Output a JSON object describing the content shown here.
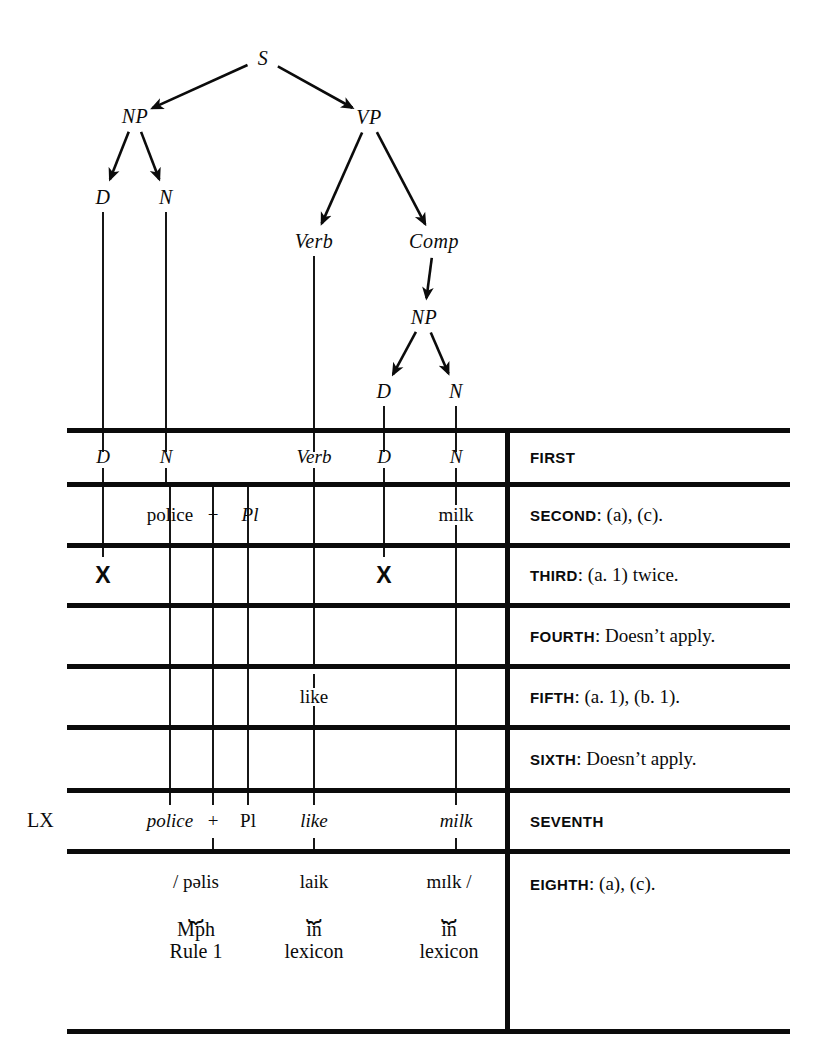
{
  "figure": {
    "type": "syntax-tree-with-derivation-table",
    "colors": {
      "ink": "#0b0b0b",
      "paper": "#ffffff"
    }
  },
  "tree": {
    "nodes": [
      {
        "id": "S",
        "label": "S",
        "x": 263,
        "y": 58
      },
      {
        "id": "NP1",
        "label": "NP",
        "x": 135,
        "y": 116
      },
      {
        "id": "VP",
        "label": "VP",
        "x": 369,
        "y": 117
      },
      {
        "id": "D1",
        "label": "D",
        "x": 103,
        "y": 197
      },
      {
        "id": "N1",
        "label": "N",
        "x": 166,
        "y": 197
      },
      {
        "id": "Verb",
        "label": "Verb",
        "x": 314,
        "y": 241
      },
      {
        "id": "Comp",
        "label": "Comp",
        "x": 434,
        "y": 241
      },
      {
        "id": "NP2",
        "label": "NP",
        "x": 424,
        "y": 317
      },
      {
        "id": "D2",
        "label": "D",
        "x": 384,
        "y": 391
      },
      {
        "id": "N2",
        "label": "N",
        "x": 456,
        "y": 391
      }
    ],
    "edges": [
      {
        "from": "S",
        "to": "NP1"
      },
      {
        "from": "S",
        "to": "VP"
      },
      {
        "from": "NP1",
        "to": "D1"
      },
      {
        "from": "NP1",
        "to": "N1"
      },
      {
        "from": "VP",
        "to": "Verb"
      },
      {
        "from": "VP",
        "to": "Comp"
      },
      {
        "from": "Comp",
        "to": "NP2"
      },
      {
        "from": "NP2",
        "to": "D2"
      },
      {
        "from": "NP2",
        "to": "N2"
      }
    ]
  },
  "table": {
    "left": 67,
    "right": 790,
    "divider_x": 507,
    "rules_y": [
      430,
      484,
      545,
      605,
      666,
      727,
      790,
      851,
      1031
    ],
    "columns": [
      {
        "name": "D-subject",
        "x": 103
      },
      {
        "name": "N-subject",
        "x": 166
      },
      {
        "name": "police",
        "x": 170
      },
      {
        "name": "plus",
        "x": 213
      },
      {
        "name": "Pl",
        "x": 248
      },
      {
        "name": "Verb",
        "x": 314
      },
      {
        "name": "D-object",
        "x": 384
      },
      {
        "name": "N-object",
        "x": 456
      }
    ],
    "rows": [
      {
        "id": "first",
        "ordinal": "FIRST",
        "note": "",
        "cells": [
          {
            "text": "D",
            "x": 103,
            "style": "italic"
          },
          {
            "text": "N",
            "x": 166,
            "style": "italic"
          },
          {
            "text": "Verb",
            "x": 314,
            "style": "italic"
          },
          {
            "text": "D",
            "x": 384,
            "style": "italic"
          },
          {
            "text": "N",
            "x": 456,
            "style": "italic"
          }
        ]
      },
      {
        "id": "second",
        "ordinal": "SECOND",
        "note": ": (a), (c).",
        "cells": [
          {
            "text": "police",
            "x": 170,
            "style": "roman"
          },
          {
            "text": "+",
            "x": 213,
            "style": "roman"
          },
          {
            "text": "Pl",
            "x": 250,
            "style": "italic"
          },
          {
            "text": "milk",
            "x": 456,
            "style": "roman"
          }
        ]
      },
      {
        "id": "third",
        "ordinal": "THIRD",
        "note": ": (a. 1) twice.",
        "cells": [
          {
            "text": "X",
            "x": 103,
            "style": "xmark"
          },
          {
            "text": "X",
            "x": 384,
            "style": "xmark"
          }
        ]
      },
      {
        "id": "fourth",
        "ordinal": "FOURTH",
        "note": ": Doesn’t apply.",
        "cells": []
      },
      {
        "id": "fifth",
        "ordinal": "FIFTH",
        "note": ": (a. 1), (b. 1).",
        "cells": [
          {
            "text": "like",
            "x": 314,
            "style": "roman"
          }
        ]
      },
      {
        "id": "sixth",
        "ordinal": "SIXTH",
        "note": ": Doesn’t apply.",
        "cells": []
      },
      {
        "id": "seventh",
        "ordinal": "SEVENTH",
        "note": "",
        "cells": [
          {
            "text": "police",
            "x": 170,
            "style": "italic"
          },
          {
            "text": "+",
            "x": 213,
            "style": "roman"
          },
          {
            "text": "Pl",
            "x": 248,
            "style": "roman"
          },
          {
            "text": "like",
            "x": 314,
            "style": "italic"
          },
          {
            "text": "milk",
            "x": 456,
            "style": "italic"
          }
        ]
      },
      {
        "id": "eighth",
        "ordinal": "EIGHTH",
        "note": ": (a), (c).",
        "cells": []
      }
    ],
    "lx_label": {
      "text": "LX",
      "x": 27,
      "y": 820
    },
    "phonetics": [
      {
        "text": "/ pəlis",
        "x": 196,
        "y": 882
      },
      {
        "text": "laik",
        "x": 314,
        "y": 882
      },
      {
        "text": "mɪlk /",
        "x": 449,
        "y": 882
      }
    ],
    "brace_groups": [
      {
        "x": 196,
        "glyph": "⏟",
        "lines": [
          "Mph",
          "Rule 1"
        ]
      },
      {
        "x": 314,
        "glyph": "⏟",
        "lines": [
          "in",
          "lexicon"
        ]
      },
      {
        "x": 449,
        "glyph": "⏟",
        "lines": [
          "in",
          "lexicon"
        ]
      }
    ]
  }
}
